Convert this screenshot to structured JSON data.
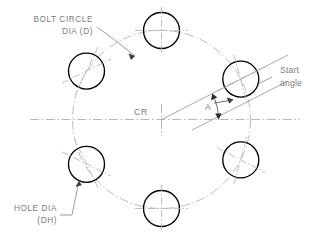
{
  "drawing": {
    "title": "Bolt Circle Hole Pattern",
    "background_color": "#ffffff",
    "line_color": "#000000",
    "construction_color": "#b4b4b4",
    "text_color": "#7b7b7b",
    "labels": {
      "bolt_circle_line1": "BOLT CIRCLE",
      "bolt_circle_line2": "DIA  (D)",
      "hole_dia_line1": "HOLE  DIA",
      "hole_dia_line2": "(DH)",
      "center_ref": "CR",
      "start_angle_line1": "Start",
      "start_angle_line2": "angle",
      "angle_symbol": "A"
    },
    "geometry": {
      "center_x": 161.5,
      "center_y": 119.5,
      "bolt_circle_radius": 89,
      "hole_radius": 18,
      "hole_count": 6,
      "start_angle_deg": 27,
      "holes": [
        {
          "name": "hole-1-right-upper",
          "cx": 240.8,
          "cy": 79.1
        },
        {
          "name": "hole-2-top",
          "cx": 161.5,
          "cy": 30.5
        },
        {
          "name": "hole-3-left-upper",
          "cx": 86.5,
          "cy": 71.1
        },
        {
          "name": "hole-4-left-lower",
          "cx": 86.5,
          "cy": 164.3
        },
        {
          "name": "hole-5-bottom",
          "cx": 161.5,
          "cy": 208.5
        },
        {
          "name": "hole-6-right-lower",
          "cx": 240.8,
          "cy": 159.9
        }
      ]
    }
  }
}
